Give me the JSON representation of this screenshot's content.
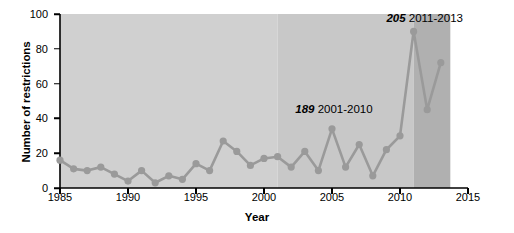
{
  "chart_data": {
    "type": "line",
    "title": "",
    "xlabel": "Year",
    "ylabel": "Number of restrictions",
    "xlim": [
      1985,
      2015
    ],
    "ylim": [
      0,
      100
    ],
    "xticks": [
      1985,
      1990,
      1995,
      2000,
      2005,
      2010,
      2015
    ],
    "yticks": [
      0,
      20,
      40,
      60,
      80,
      100
    ],
    "grid": false,
    "legend_position": "none",
    "series": [
      {
        "name": "Number of restrictions",
        "color": "#9a9a9a",
        "marker": "circle",
        "x": [
          1985,
          1986,
          1987,
          1988,
          1989,
          1990,
          1991,
          1992,
          1993,
          1994,
          1995,
          1996,
          1997,
          1998,
          1999,
          2000,
          2001,
          2002,
          2003,
          2004,
          2005,
          2006,
          2007,
          2008,
          2009,
          2010,
          2011,
          2012,
          2013
        ],
        "values": [
          16,
          11,
          10,
          12,
          8,
          4,
          10,
          3,
          7,
          5,
          14,
          10,
          27,
          21,
          13,
          17,
          18,
          12,
          21,
          10,
          34,
          12,
          25,
          7,
          22,
          30,
          90,
          45,
          72
        ]
      }
    ],
    "shaded_bands": [
      {
        "name": "band-1985-2001",
        "from": 1985,
        "to": 2001,
        "color": "#d0d0d0"
      },
      {
        "name": "band-2001-2011",
        "from": 2001,
        "to": 2011,
        "color": "#c8c8c8"
      },
      {
        "name": "band-2011-2013",
        "from": 2011,
        "to": 2013.7,
        "color": "#b0b0b0"
      }
    ],
    "annotations": [
      {
        "name": "annotation-2001-2010",
        "number": "189",
        "range": "2001-2010",
        "x": 2002.3,
        "y": 45
      },
      {
        "name": "annotation-2011-2013",
        "number": "205",
        "range": "2011-2013",
        "x": 2009.0,
        "y": 97
      }
    ]
  }
}
